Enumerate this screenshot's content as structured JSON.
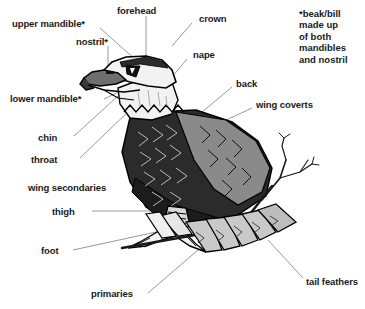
{
  "diagram": {
    "background_color": "#ffffff",
    "text_color": "#1a1a1a",
    "leader_line_color": "#8d8d8d",
    "body_dark_color": "#2b2b2b",
    "wing_gray_color": "#8a8a8a",
    "tail_light_color": "#c9c9c9",
    "head_white_color": "#f2f2f2",
    "note": "*beak/bill\nmade up\nof both\nmandibles\nand nostril",
    "labels": [
      {
        "id": "upper-mandible",
        "text": "upper mandible*"
      },
      {
        "id": "forehead",
        "text": "forehead"
      },
      {
        "id": "crown",
        "text": "crown"
      },
      {
        "id": "nostril",
        "text": "nostril*"
      },
      {
        "id": "nape",
        "text": "nape"
      },
      {
        "id": "lower-mandible",
        "text": "lower mandible*"
      },
      {
        "id": "back",
        "text": "back"
      },
      {
        "id": "wing-coverts",
        "text": "wing coverts"
      },
      {
        "id": "chin",
        "text": "chin"
      },
      {
        "id": "throat",
        "text": "throat"
      },
      {
        "id": "wing-secondaries",
        "text": "wing secondaries"
      },
      {
        "id": "thigh",
        "text": "thigh"
      },
      {
        "id": "foot",
        "text": "foot"
      },
      {
        "id": "primaries",
        "text": "primaries"
      },
      {
        "id": "tail-feathers",
        "text": "tail feathers"
      }
    ]
  }
}
